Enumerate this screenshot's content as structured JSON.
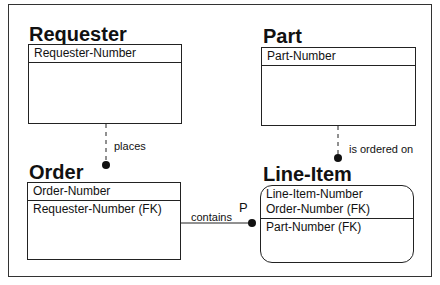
{
  "entities": {
    "requester": {
      "name": "Requester",
      "key": [
        "Requester-Number"
      ],
      "nonkey": []
    },
    "part": {
      "name": "Part",
      "key": [
        "Part-Number"
      ],
      "nonkey": []
    },
    "order": {
      "name": "Order",
      "key": [
        "Order-Number"
      ],
      "nonkey": [
        "Requester-Number (FK)"
      ]
    },
    "line_item": {
      "name": "Line-Item",
      "key": [
        "Line-Item-Number",
        "Order-Number (FK)"
      ],
      "nonkey": [
        "Part-Number (FK)"
      ]
    }
  },
  "relationships": {
    "places": {
      "label": "places",
      "from": "Requester",
      "to": "Order"
    },
    "is_ordered_on": {
      "label": "is ordered on",
      "from": "Part",
      "to": "Line-Item"
    },
    "contains": {
      "label": "contains",
      "cardinality": "P",
      "from": "Order",
      "to": "Line-Item"
    }
  }
}
